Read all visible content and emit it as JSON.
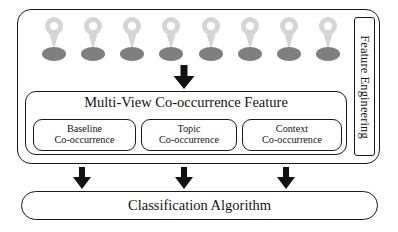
{
  "diagram": {
    "title_text": "",
    "outer_container": {
      "side_label": "Feature Engineering"
    },
    "pins": {
      "count": 8,
      "icon": "map-pin-icon",
      "body_color": "#d5d5d5",
      "hole_color": "#ffffff",
      "shadow_color": "#7f7f7f",
      "items": [
        {
          "label": ""
        },
        {
          "label": ""
        },
        {
          "label": ""
        },
        {
          "label": ""
        },
        {
          "label": ""
        },
        {
          "label": ""
        },
        {
          "label": ""
        },
        {
          "label": ""
        }
      ]
    },
    "multi_view_box": {
      "title": "Multi-View Co-occurrence Feature",
      "sub_boxes": [
        {
          "line1": "Baseline",
          "line2": "Co-occurrence"
        },
        {
          "line1": "Topic",
          "line2": "Co-occurrence"
        },
        {
          "line1": "Context",
          "line2": "Co-occurrence"
        }
      ]
    },
    "classification_box": {
      "label": "Classification Algorithm"
    },
    "arrows": [
      {
        "name": "arrow-pins-to-multiview",
        "direction": "down"
      },
      {
        "name": "arrow-baseline-to-classification",
        "direction": "down"
      },
      {
        "name": "arrow-topic-to-classification",
        "direction": "down"
      },
      {
        "name": "arrow-context-to-classification",
        "direction": "down"
      }
    ],
    "colors": {
      "stroke": "#1a1a1a",
      "background": "#ffffff",
      "arrow_fill": "#111111",
      "pin_light_gray": "#d5d5d5",
      "pin_dark_gray": "#7f7f7f"
    }
  }
}
